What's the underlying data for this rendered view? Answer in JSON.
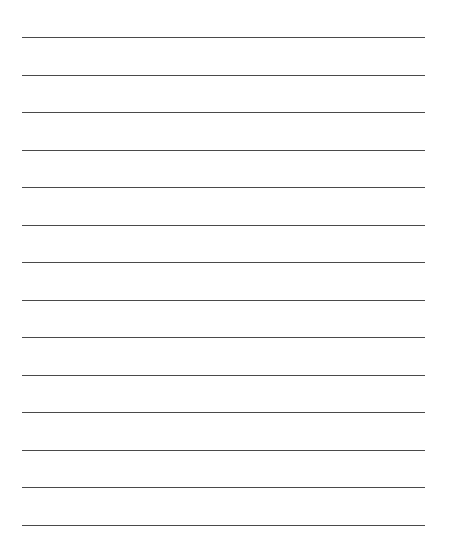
{
  "page": {
    "background": "#ffffff",
    "top_fragment_text": ""
  },
  "ruled_lines": {
    "count": 14,
    "first_y": 37,
    "spacing": 37.5,
    "left": 22,
    "width": 403,
    "color": "#4a4a4a"
  }
}
